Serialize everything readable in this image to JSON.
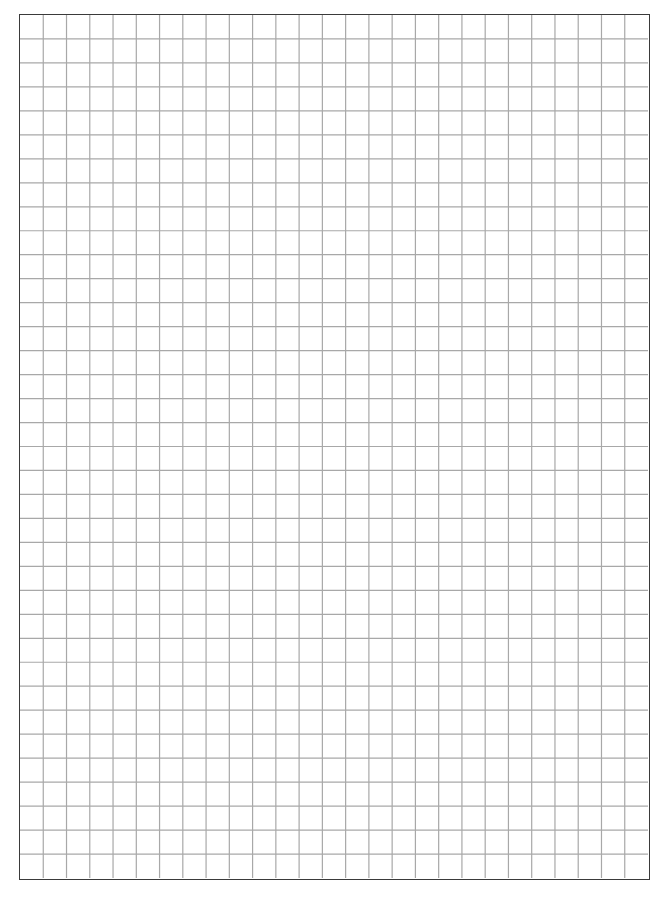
{
  "sheet": {
    "type": "graph-paper",
    "columns": 27,
    "rows": 36,
    "border_color": "#3a3a3a",
    "line_color": "#a8a8a8",
    "background": "#ffffff"
  }
}
